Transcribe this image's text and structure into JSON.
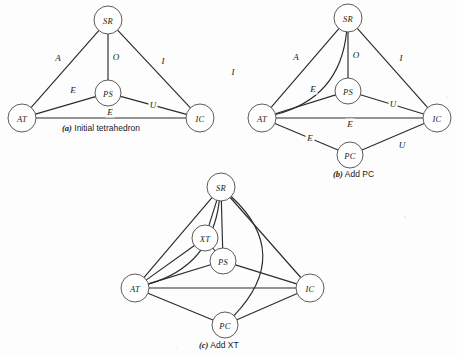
{
  "figure": {
    "background_color": "#fdfdfd",
    "ink_color": "#2b2b2b",
    "node_fill": "#ffffff"
  },
  "panels": [
    {
      "id": "panel-a",
      "caption_tag": "(a)",
      "caption_text": " Initial tetrahedron",
      "caption_x": 62,
      "caption_y": 123,
      "nodes": [
        {
          "id": "SR",
          "label": "SR",
          "cx": 108,
          "cy": 20,
          "r": 14
        },
        {
          "id": "PS",
          "label": "PS",
          "cx": 108,
          "cy": 93,
          "r": 13
        },
        {
          "id": "AT",
          "label": "AT",
          "cx": 22,
          "cy": 118,
          "r": 14
        },
        {
          "id": "IC",
          "label": "IC",
          "cx": 200,
          "cy": 118,
          "r": 14
        }
      ],
      "edges": [
        {
          "from": "AT",
          "to": "SR",
          "label": "A",
          "lx": 58,
          "ly": 58,
          "curve": 0
        },
        {
          "from": "SR",
          "to": "PS",
          "label": "O",
          "lx": 116,
          "ly": 57,
          "curve": 0
        },
        {
          "from": "SR",
          "to": "IC",
          "label": "I",
          "lx": 163,
          "ly": 61,
          "curve": 0
        },
        {
          "from": "AT",
          "to": "PS",
          "label": "E",
          "lx": 73,
          "ly": 90,
          "curve": 0
        },
        {
          "from": "AT",
          "to": "IC",
          "label": "E",
          "lx": 110,
          "ly": 112,
          "curve": 0
        },
        {
          "from": "PS",
          "to": "IC",
          "label": "U",
          "lx": 153,
          "ly": 105,
          "curve": 0
        }
      ]
    },
    {
      "id": "panel-b",
      "caption_tag": "(b)",
      "caption_text": " Add PC",
      "caption_x": 333,
      "caption_y": 169,
      "nodes": [
        {
          "id": "SR",
          "label": "SR",
          "cx": 348,
          "cy": 18,
          "r": 14
        },
        {
          "id": "PS",
          "label": "PS",
          "cx": 348,
          "cy": 91,
          "r": 13
        },
        {
          "id": "AT",
          "label": "AT",
          "cx": 262,
          "cy": 118,
          "r": 14
        },
        {
          "id": "IC",
          "label": "IC",
          "cx": 437,
          "cy": 118,
          "r": 14
        },
        {
          "id": "PC",
          "label": "PC",
          "cx": 350,
          "cy": 155,
          "r": 13
        }
      ],
      "edges": [
        {
          "from": "SR",
          "to": "AT",
          "label": "I",
          "lx": 233,
          "ly": 72,
          "curve": -46
        },
        {
          "from": "AT",
          "to": "SR",
          "label": "A",
          "lx": 296,
          "ly": 57,
          "curve": 0
        },
        {
          "from": "SR",
          "to": "PS",
          "label": "O",
          "lx": 356,
          "ly": 55,
          "curve": 0
        },
        {
          "from": "SR",
          "to": "IC",
          "label": "I",
          "lx": 401,
          "ly": 58,
          "curve": 0
        },
        {
          "from": "AT",
          "to": "PS",
          "label": "E",
          "lx": 313,
          "ly": 89,
          "curve": 0
        },
        {
          "from": "PS",
          "to": "IC",
          "label": "U",
          "lx": 393,
          "ly": 104,
          "curve": 0
        },
        {
          "from": "AT",
          "to": "IC",
          "label": "E",
          "lx": 350,
          "ly": 124,
          "curve": 0
        },
        {
          "from": "AT",
          "to": "PC",
          "label": "E",
          "lx": 310,
          "ly": 138,
          "curve": 0
        },
        {
          "from": "PC",
          "to": "IC",
          "label": "U",
          "lx": 402,
          "ly": 145,
          "curve": 0
        }
      ]
    },
    {
      "id": "panel-c",
      "caption_tag": "(c)",
      "caption_text": " Add XT",
      "caption_x": 199,
      "caption_y": 340,
      "nodes": [
        {
          "id": "SR",
          "label": "SR",
          "cx": 221,
          "cy": 187,
          "r": 14
        },
        {
          "id": "XT",
          "label": "XT",
          "cx": 205,
          "cy": 238,
          "r": 13
        },
        {
          "id": "PS",
          "label": "PS",
          "cx": 223,
          "cy": 261,
          "r": 13
        },
        {
          "id": "AT",
          "label": "AT",
          "cx": 135,
          "cy": 288,
          "r": 14
        },
        {
          "id": "IC",
          "label": "IC",
          "cx": 310,
          "cy": 288,
          "r": 14
        },
        {
          "id": "PC",
          "label": "PC",
          "cx": 225,
          "cy": 325,
          "r": 13
        }
      ],
      "edges": [
        {
          "from": "SR",
          "to": "AT",
          "label": "",
          "lx": 0,
          "ly": 0,
          "curve": -44
        },
        {
          "from": "SR",
          "to": "PC",
          "label": "",
          "lx": 0,
          "ly": 0,
          "curve": -70
        },
        {
          "from": "SR",
          "to": "AT",
          "label": "",
          "lx": 0,
          "ly": 0,
          "curve": 0
        },
        {
          "from": "SR",
          "to": "XT",
          "label": "",
          "lx": 0,
          "ly": 0,
          "curve": 0
        },
        {
          "from": "SR",
          "to": "PS",
          "label": "",
          "lx": 0,
          "ly": 0,
          "curve": 0
        },
        {
          "from": "SR",
          "to": "IC",
          "label": "",
          "lx": 0,
          "ly": 0,
          "curve": 0
        },
        {
          "from": "XT",
          "to": "AT",
          "label": "",
          "lx": 0,
          "ly": 0,
          "curve": 0
        },
        {
          "from": "XT",
          "to": "PS",
          "label": "",
          "lx": 0,
          "ly": 0,
          "curve": 0
        },
        {
          "from": "PS",
          "to": "AT",
          "label": "",
          "lx": 0,
          "ly": 0,
          "curve": 0
        },
        {
          "from": "PS",
          "to": "IC",
          "label": "",
          "lx": 0,
          "ly": 0,
          "curve": 0
        },
        {
          "from": "AT",
          "to": "IC",
          "label": "",
          "lx": 0,
          "ly": 0,
          "curve": 0
        },
        {
          "from": "AT",
          "to": "PC",
          "label": "",
          "lx": 0,
          "ly": 0,
          "curve": 0
        },
        {
          "from": "PC",
          "to": "IC",
          "label": "",
          "lx": 0,
          "ly": 0,
          "curve": 0
        }
      ]
    }
  ]
}
